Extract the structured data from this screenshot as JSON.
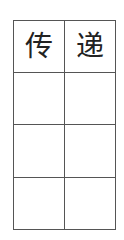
{
  "worksheet": {
    "rows": [
      [
        "传",
        "递"
      ],
      [
        "",
        ""
      ],
      [
        "",
        ""
      ],
      [
        "",
        ""
      ]
    ]
  },
  "colors": {
    "grid_line": "#555555",
    "text": "#222222"
  }
}
